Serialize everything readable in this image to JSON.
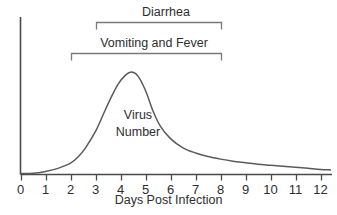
{
  "chart_data": {
    "type": "line",
    "title": "",
    "xlabel": "Days Post Infection",
    "ylabel": "",
    "xlim": [
      0,
      12.4
    ],
    "ylim": [
      0,
      1.05
    ],
    "grid": false,
    "legend_position": "none",
    "axis": {
      "x_ticks": [
        "0",
        "1",
        "2",
        "3",
        "4",
        "5",
        "6",
        "7",
        "8",
        "9",
        "10",
        "11",
        "12"
      ],
      "x_tick_values": [
        0,
        1,
        2,
        3,
        4,
        5,
        6,
        7,
        8,
        9,
        10,
        11,
        12
      ],
      "y_ticks": [],
      "y_axis_visible": true,
      "x_axis_visible": true
    },
    "series": [
      {
        "name": "Virus Number",
        "color": "#5a5a5a",
        "x": [
          0.0,
          0.5,
          1.0,
          1.5,
          2.0,
          2.3,
          2.6,
          3.0,
          3.3,
          3.6,
          3.9,
          4.2,
          4.45,
          4.7,
          5.0,
          5.3,
          5.6,
          6.0,
          6.5,
          7.0,
          7.5,
          8.0,
          8.5,
          9.0,
          9.5,
          10.0,
          10.5,
          11.0,
          11.5,
          12.0,
          12.4
        ],
        "y": [
          0.01,
          0.012,
          0.03,
          0.06,
          0.11,
          0.17,
          0.26,
          0.42,
          0.58,
          0.74,
          0.88,
          0.97,
          1.0,
          0.96,
          0.82,
          0.62,
          0.47,
          0.35,
          0.26,
          0.21,
          0.175,
          0.15,
          0.13,
          0.115,
          0.1,
          0.09,
          0.08,
          0.07,
          0.06,
          0.05,
          0.045
        ]
      }
    ],
    "annotations": [
      {
        "id": "diarrhea",
        "label": "Diarrhea",
        "type": "bracket",
        "x_start": 3,
        "x_end": 8,
        "label_x": 5.5
      },
      {
        "id": "vomiting-and-fever",
        "label": "Vomiting and Fever",
        "type": "bracket",
        "x_start": 2,
        "x_end": 8,
        "label_x": 5.0
      },
      {
        "id": "virus-number",
        "label_line1": "Virus",
        "label_line2": "Number",
        "type": "inline-series-label",
        "x": 4.7
      }
    ],
    "colors": {
      "curve": "#5a5a5a",
      "axis": "#4a4a4a",
      "bracket": "#7a7a7a",
      "text": "#2e2e2e",
      "background": "#ffffff"
    }
  }
}
